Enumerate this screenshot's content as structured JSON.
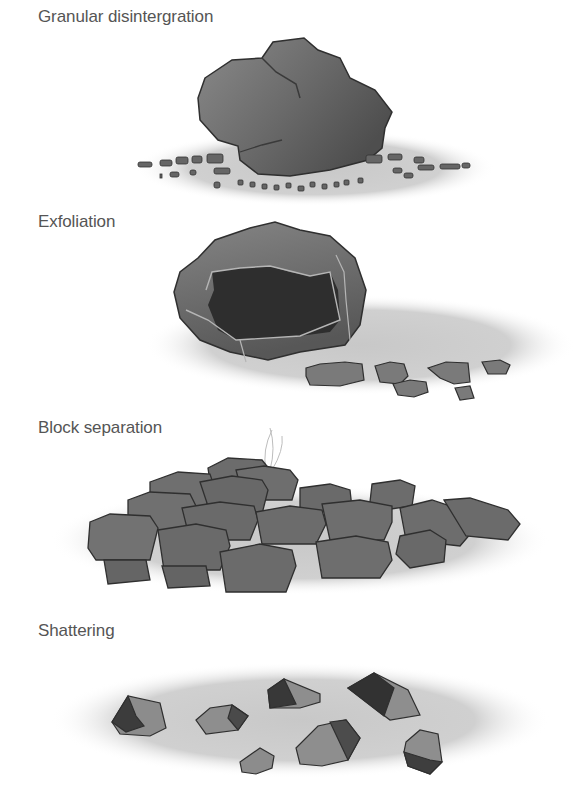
{
  "figure": {
    "panels": [
      {
        "id": "granular",
        "label": "Granular disintergration"
      },
      {
        "id": "exfoliation",
        "label": "Exfoliation"
      },
      {
        "id": "block",
        "label": "Block separation"
      },
      {
        "id": "shattering",
        "label": "Shattering"
      }
    ],
    "colors": {
      "text": "#555555",
      "ground": "#d2d2d2",
      "rock_light": "#8e8e8e",
      "rock_mid": "#6f6f6f",
      "rock_dark": "#3c3c3c",
      "outline": "#2f2f2f",
      "crack": "#b5b5b5"
    }
  }
}
